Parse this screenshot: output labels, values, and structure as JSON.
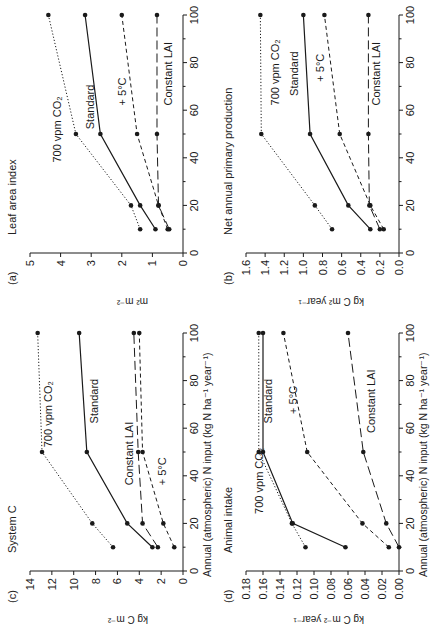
{
  "chart_data": [
    {
      "id": "a",
      "panel_label": "(a)",
      "type": "line",
      "title": "Leaf area index",
      "xlabel": "",
      "ylabel": "m² m⁻²",
      "x": [
        10,
        20,
        50,
        100
      ],
      "xlim": [
        0,
        100
      ],
      "ylim": [
        0,
        5
      ],
      "xticks": [
        0,
        20,
        40,
        60,
        80,
        100
      ],
      "yticks": [
        0,
        1,
        2,
        3,
        4,
        5
      ],
      "series": [
        {
          "name": "700 vpm CO2",
          "style": "dotted",
          "values": [
            1.4,
            1.7,
            3.5,
            4.4
          ]
        },
        {
          "name": "Standard",
          "style": "solid",
          "values": [
            0.9,
            1.4,
            2.7,
            3.2
          ]
        },
        {
          "name": "+ 5°C",
          "style": "dashed",
          "values": [
            0.5,
            0.8,
            1.5,
            2.0
          ]
        },
        {
          "name": "Constant LAI",
          "style": "longdash",
          "values": [
            0.45,
            0.8,
            0.85,
            0.85
          ]
        }
      ]
    },
    {
      "id": "b",
      "panel_label": "(b)",
      "type": "line",
      "title": "Net annual primary production",
      "xlabel": "",
      "ylabel": "kg C m² year⁻¹",
      "x": [
        10,
        20,
        50,
        100
      ],
      "xlim": [
        0,
        100
      ],
      "ylim": [
        0,
        1.6
      ],
      "xticks": [
        0,
        20,
        40,
        60,
        80,
        100
      ],
      "yticks": [
        0.0,
        0.2,
        0.4,
        0.6,
        0.8,
        1.0,
        1.2,
        1.4,
        1.6
      ],
      "series": [
        {
          "name": "700 vpm CO2",
          "style": "dotted",
          "values": [
            0.7,
            0.88,
            1.44,
            1.45
          ]
        },
        {
          "name": "Standard",
          "style": "solid",
          "values": [
            0.3,
            0.53,
            0.93,
            1.0
          ]
        },
        {
          "name": "+ 5°C",
          "style": "dashed",
          "values": [
            0.16,
            0.3,
            0.62,
            0.78
          ]
        },
        {
          "name": "Constant LAI",
          "style": "longdash",
          "values": [
            0.2,
            0.31,
            0.32,
            0.32
          ]
        }
      ]
    },
    {
      "id": "c",
      "panel_label": "(c)",
      "type": "line",
      "title": "System C",
      "xlabel": "Annual (atmospheric) N input (kg N ha⁻¹ year⁻¹)",
      "ylabel": "kg C m⁻²",
      "x": [
        10,
        20,
        50,
        100
      ],
      "xlim": [
        0,
        100
      ],
      "ylim": [
        0,
        14
      ],
      "xticks": [
        0,
        20,
        40,
        60,
        80,
        100
      ],
      "yticks": [
        0,
        2,
        4,
        6,
        8,
        10,
        12,
        14
      ],
      "series": [
        {
          "name": "700 vpm CO2",
          "style": "dotted",
          "values": [
            6.4,
            8.3,
            12.9,
            13.3
          ]
        },
        {
          "name": "Standard",
          "style": "solid",
          "values": [
            2.8,
            5.1,
            8.8,
            9.5
          ]
        },
        {
          "name": "Constant LAI",
          "style": "longdash",
          "values": [
            2.3,
            3.7,
            4.1,
            4.5
          ]
        },
        {
          "name": "+ 5°C",
          "style": "dashed",
          "values": [
            0.8,
            1.8,
            3.7,
            4.0
          ]
        }
      ]
    },
    {
      "id": "d",
      "panel_label": "(d)",
      "type": "line",
      "title": "Animal intake",
      "xlabel": "Annual (atmospheric) N input (kg N ha⁻¹ year⁻¹)",
      "ylabel": "kg C m⁻² year⁻¹",
      "x": [
        10,
        20,
        50,
        100
      ],
      "xlim": [
        0,
        100
      ],
      "ylim": [
        0,
        0.18
      ],
      "xticks": [
        0,
        20,
        40,
        60,
        80,
        100
      ],
      "yticks": [
        0.0,
        0.02,
        0.04,
        0.06,
        0.08,
        0.1,
        0.12,
        0.14,
        0.16,
        0.18
      ],
      "series": [
        {
          "name": "700 vpm CO2",
          "style": "dotted",
          "values": [
            0.11,
            0.126,
            0.165,
            0.165
          ]
        },
        {
          "name": "Standard",
          "style": "solid",
          "values": [
            0.063,
            0.125,
            0.16,
            0.16
          ]
        },
        {
          "name": "+ 5°C",
          "style": "dashed",
          "values": [
            0.012,
            0.043,
            0.108,
            0.136
          ]
        },
        {
          "name": "Constant LAI",
          "style": "longdash",
          "values": [
            0.0,
            0.015,
            0.042,
            0.06
          ]
        }
      ]
    }
  ],
  "panels": {
    "a": {
      "label": "(a)",
      "title": "Leaf area index",
      "ylabel": "m² m⁻²",
      "series_labels": [
        "700 vpm CO₂",
        "Standard",
        "+ 5°C",
        "Constant LAI"
      ]
    },
    "b": {
      "label": "(b)",
      "title": "Net annual primary production",
      "ylabel": "kg C m² year⁻¹",
      "series_labels": [
        "700 vpm CO₂",
        "Standard",
        "+ 5°C",
        "Constant LAI"
      ]
    },
    "c": {
      "label": "(c)",
      "title": "System C",
      "ylabel": "kg C m⁻²",
      "xlabel": "Annual (atmospheric) N input (kg N ha⁻¹ year⁻¹)",
      "series_labels": [
        "700 vpm CO₂",
        "Standard",
        "Constant LAI",
        "+ 5°C"
      ]
    },
    "d": {
      "label": "(d)",
      "title": "Animal intake",
      "ylabel": "kg C m⁻² year⁻¹",
      "xlabel": "Annual (atmospheric) N input (kg N ha⁻¹ year⁻¹)",
      "series_labels": [
        "700 vpm CO₂",
        "Standard",
        "+ 5°C",
        "Constant LAI"
      ]
    }
  },
  "ink_color": "#1a1a1a"
}
